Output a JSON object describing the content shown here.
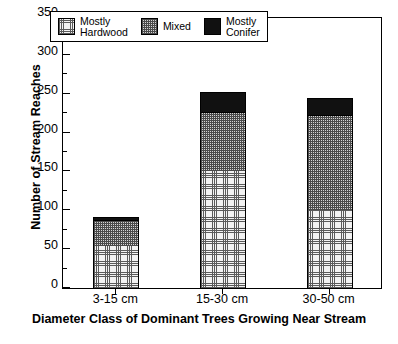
{
  "chart_data": {
    "type": "bar",
    "subtype": "stacked-bar",
    "title": "",
    "xlabel": "Diameter Class of Dominant Trees Growing Near Stream",
    "ylabel": "Number of Stream Reaches",
    "categories": [
      "3-15 cm",
      "15-30 cm",
      "30-50 cm"
    ],
    "ylim": [
      0,
      350
    ],
    "yticks": [
      0,
      50,
      100,
      150,
      200,
      250,
      300,
      350
    ],
    "ytick_labels": [
      "0",
      "50",
      "100",
      "150",
      "200",
      "250",
      "300",
      "350"
    ],
    "yminor_ticks": [
      25,
      75,
      125,
      175,
      225,
      275,
      325
    ],
    "grid": false,
    "legend_position": "top-center-inside",
    "series": [
      {
        "name": "Mostly Hardwood",
        "legend_label": "Mostly\nHardwood",
        "pattern": "fine-dotted-grid",
        "color": "#f2f2f2",
        "values": [
          54,
          151,
          101
        ]
      },
      {
        "name": "Mixed",
        "legend_label": "Mixed",
        "pattern": "medium-checker",
        "color": "#d4d4d4",
        "values": [
          34,
          75,
          121
        ]
      },
      {
        "name": "Mostly Conifer",
        "legend_label": "Mostly\nConifer",
        "pattern": "solid",
        "color": "#111111",
        "values": [
          4,
          26,
          23
        ]
      }
    ],
    "cumulative_tops": [
      [
        54,
        88,
        92
      ],
      [
        151,
        226,
        252
      ],
      [
        101,
        222,
        245
      ]
    ],
    "totals": [
      92,
      252,
      245
    ]
  }
}
